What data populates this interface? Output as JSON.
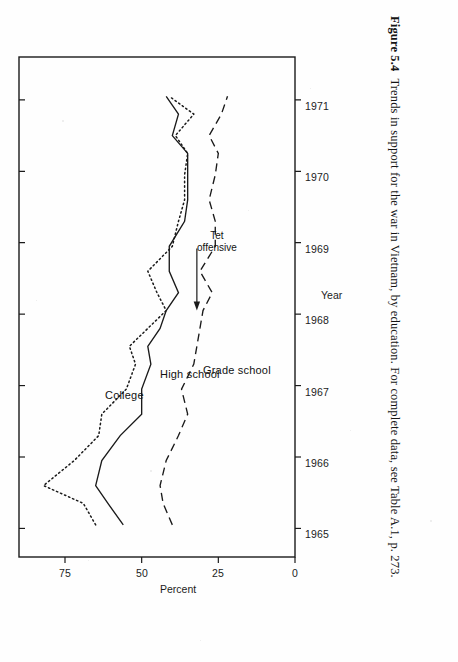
{
  "caption": {
    "figure_number": "Figure 5.4",
    "text": "Trends in support for the war in Vietnam, by education. For complete data, see Table A.1, p. 273."
  },
  "chart_data": {
    "type": "line",
    "title": "",
    "xlabel": "Year",
    "ylabel": "Percent",
    "xlim": [
      1964.6,
      1971.6
    ],
    "ylim": [
      0,
      90
    ],
    "yticks": [
      0,
      25,
      50,
      75
    ],
    "ytick_labels": [
      "0",
      "25",
      "50",
      "75"
    ],
    "xticks": [
      1965,
      1966,
      1967,
      1968,
      1969,
      1970,
      1971
    ],
    "xtick_labels": [
      "1965",
      "1966",
      "1967",
      "1968",
      "1969",
      "1970",
      "1971"
    ],
    "grid": false,
    "legend_position": "inline-labels",
    "annotations": [
      {
        "label": "Tet\noffensive",
        "line1": "Tet",
        "line2": "offensive",
        "x": 1968.05,
        "y": 32
      }
    ],
    "series": [
      {
        "name": "College",
        "label": "College",
        "style": "dotted",
        "x": [
          1965.05,
          1965.35,
          1965.6,
          1965.95,
          1966.3,
          1966.6,
          1966.95,
          1967.3,
          1967.55,
          1967.8,
          1968.05,
          1968.3,
          1968.6,
          1968.95,
          1969.3,
          1969.6,
          1969.95,
          1970.25,
          1970.5,
          1970.8,
          1971.05
        ],
        "y": [
          65,
          69,
          82,
          72,
          64,
          63,
          55,
          52,
          54,
          48,
          42,
          45,
          48,
          40,
          38,
          36,
          36,
          35,
          39,
          33,
          41
        ],
        "points": [
          {
            "x": 1965.05,
            "y": 65
          },
          {
            "x": 1965.35,
            "y": 69
          },
          {
            "x": 1965.6,
            "y": 82
          },
          {
            "x": 1965.95,
            "y": 72
          },
          {
            "x": 1966.3,
            "y": 64
          },
          {
            "x": 1966.6,
            "y": 63
          },
          {
            "x": 1966.95,
            "y": 55
          },
          {
            "x": 1967.3,
            "y": 52
          },
          {
            "x": 1967.55,
            "y": 54
          },
          {
            "x": 1967.8,
            "y": 48
          },
          {
            "x": 1968.05,
            "y": 42
          },
          {
            "x": 1968.3,
            "y": 45
          },
          {
            "x": 1968.6,
            "y": 48
          },
          {
            "x": 1968.95,
            "y": 40
          },
          {
            "x": 1969.3,
            "y": 38
          },
          {
            "x": 1969.6,
            "y": 36
          },
          {
            "x": 1969.95,
            "y": 36
          },
          {
            "x": 1970.25,
            "y": 35
          },
          {
            "x": 1970.5,
            "y": 39
          },
          {
            "x": 1970.8,
            "y": 33
          },
          {
            "x": 1971.05,
            "y": 41
          }
        ],
        "label_pos": {
          "x": 1966.95,
          "y": 62
        }
      },
      {
        "name": "High school",
        "label": "High school",
        "style": "solid",
        "x": [
          1965.05,
          1965.35,
          1965.6,
          1965.95,
          1966.3,
          1966.6,
          1966.95,
          1967.3,
          1967.55,
          1967.8,
          1968.05,
          1968.3,
          1968.6,
          1968.95,
          1969.3,
          1969.6,
          1969.95,
          1970.25,
          1970.5,
          1970.8,
          1971.05
        ],
        "y": [
          56,
          61,
          65,
          63,
          57,
          50,
          50,
          47,
          48,
          44,
          42,
          38,
          41,
          41,
          36,
          35,
          35,
          35,
          40,
          38,
          42
        ],
        "points": [
          {
            "x": 1965.05,
            "y": 56
          },
          {
            "x": 1965.35,
            "y": 61
          },
          {
            "x": 1965.6,
            "y": 65
          },
          {
            "x": 1965.95,
            "y": 63
          },
          {
            "x": 1966.3,
            "y": 57
          },
          {
            "x": 1966.6,
            "y": 50
          },
          {
            "x": 1966.95,
            "y": 50
          },
          {
            "x": 1967.3,
            "y": 47
          },
          {
            "x": 1967.55,
            "y": 48
          },
          {
            "x": 1967.8,
            "y": 44
          },
          {
            "x": 1968.05,
            "y": 42
          },
          {
            "x": 1968.3,
            "y": 38
          },
          {
            "x": 1968.6,
            "y": 41
          },
          {
            "x": 1968.95,
            "y": 41
          },
          {
            "x": 1969.3,
            "y": 36
          },
          {
            "x": 1969.6,
            "y": 35
          },
          {
            "x": 1969.95,
            "y": 35
          },
          {
            "x": 1970.25,
            "y": 35
          },
          {
            "x": 1970.5,
            "y": 40
          },
          {
            "x": 1970.8,
            "y": 38
          },
          {
            "x": 1971.05,
            "y": 42
          }
        ],
        "label_pos": {
          "x": 1967.25,
          "y": 44
        }
      },
      {
        "name": "Grade school",
        "label": "Grade school",
        "style": "dashed",
        "x": [
          1965.05,
          1965.35,
          1965.6,
          1965.95,
          1966.3,
          1966.6,
          1966.95,
          1967.3,
          1967.55,
          1967.8,
          1968.05,
          1968.3,
          1968.6,
          1968.95,
          1969.3,
          1969.6,
          1969.95,
          1970.25,
          1970.5,
          1970.8,
          1971.05
        ],
        "y": [
          40,
          43,
          44,
          42,
          38,
          35,
          37,
          33,
          32,
          31,
          30,
          27,
          31,
          26,
          26,
          28,
          26,
          25,
          28,
          24,
          22
        ],
        "points": [
          {
            "x": 1965.05,
            "y": 40
          },
          {
            "x": 1965.35,
            "y": 43
          },
          {
            "x": 1965.6,
            "y": 44
          },
          {
            "x": 1965.95,
            "y": 42
          },
          {
            "x": 1966.3,
            "y": 38
          },
          {
            "x": 1966.6,
            "y": 35
          },
          {
            "x": 1966.95,
            "y": 37
          },
          {
            "x": 1967.3,
            "y": 33
          },
          {
            "x": 1967.55,
            "y": 32
          },
          {
            "x": 1967.8,
            "y": 31
          },
          {
            "x": 1968.05,
            "y": 30
          },
          {
            "x": 1968.3,
            "y": 27
          },
          {
            "x": 1968.6,
            "y": 31
          },
          {
            "x": 1968.95,
            "y": 26
          },
          {
            "x": 1969.3,
            "y": 26
          },
          {
            "x": 1969.6,
            "y": 28
          },
          {
            "x": 1969.95,
            "y": 26
          },
          {
            "x": 1970.25,
            "y": 25
          },
          {
            "x": 1970.5,
            "y": 28
          },
          {
            "x": 1970.8,
            "y": 24
          },
          {
            "x": 1971.05,
            "y": 22
          }
        ],
        "label_pos": {
          "x": 1967.3,
          "y": 30
        }
      }
    ]
  },
  "colors": {
    "ink": "#1a1a1a",
    "paper": "#fefefe"
  }
}
